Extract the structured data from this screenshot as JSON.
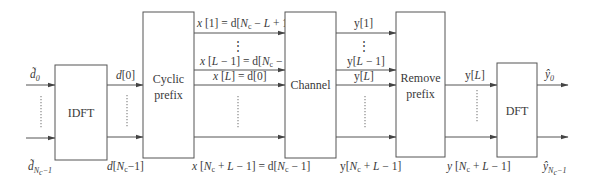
{
  "diagram": {
    "type": "block-diagram",
    "blocks": [
      {
        "id": "idft",
        "label": "IDFT"
      },
      {
        "id": "cyclic_prefix",
        "label_line1": "Cyclic",
        "label_line2": "prefix"
      },
      {
        "id": "channel",
        "label": "Channel"
      },
      {
        "id": "remove_prefix",
        "label_line1": "Remove",
        "label_line2": "prefix"
      },
      {
        "id": "dft",
        "label": "DFT"
      }
    ],
    "signals": {
      "input_top": "d̃0",
      "input_bottom": "d̃Nc−1",
      "idft_out_top": "d[0]",
      "idft_out_bottom": "d[Nc−1]",
      "cp_out_1": "x[1] = d[Nc − L + 1]",
      "cp_out_2": "x[L − 1] = d[Nc − 1]",
      "cp_out_3": "x[L] = d[0]",
      "cp_out_bottom": "x[Nc + L − 1] = d[Nc − 1]",
      "ch_out_1": "y[1]",
      "ch_out_2": "y[L − 1]",
      "ch_out_3": "y[L]",
      "ch_out_bottom": "y[Nc + L − 1]",
      "rp_out_top": "y[L]",
      "rp_out_bottom": "y[Nc + L − 1]",
      "output_top": "ŷ0",
      "output_bottom": "ŷNc−1"
    },
    "vertical_ellipsis": "⋮"
  }
}
